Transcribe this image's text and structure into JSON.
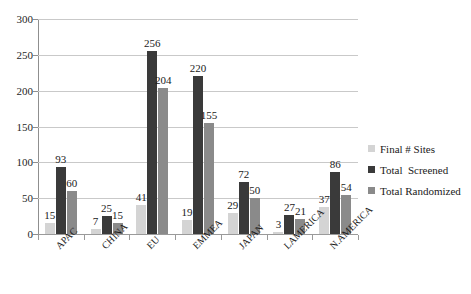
{
  "chart_data": {
    "type": "bar",
    "title": "",
    "subtitle": "",
    "xlabel": "",
    "ylabel": "",
    "ylim": [
      0,
      300
    ],
    "ytick_step": 50,
    "yticks": [
      "0",
      "50",
      "100",
      "150",
      "200",
      "250",
      "300"
    ],
    "grid": true,
    "legend_position": "right",
    "categories": [
      "APAC",
      "CHINA",
      "EU",
      "EMMEA",
      "JAPAN",
      "LAMERICA",
      "N.AMERICA"
    ],
    "series": [
      {
        "name": "Final # Sites",
        "color": "#d4d4d4",
        "values": [
          15,
          7,
          41,
          19,
          29,
          3,
          37
        ],
        "labels": [
          "15",
          "7",
          "41",
          "19",
          "29",
          "3",
          "37"
        ]
      },
      {
        "name": "Total  Screened",
        "color": "#3a3a3a",
        "values": [
          93,
          25,
          256,
          220,
          72,
          27,
          86
        ],
        "labels": [
          "93",
          "25",
          "256",
          "220",
          "72",
          "27",
          "86"
        ]
      },
      {
        "name": "Total Randomized",
        "color": "#8a8a8a",
        "values": [
          60,
          15,
          204,
          155,
          50,
          21,
          54
        ],
        "labels": [
          "60",
          "15",
          "204",
          "155",
          "50",
          "21",
          "54"
        ]
      }
    ]
  },
  "legend": {
    "items": [
      {
        "label": "Final # Sites",
        "marker": "square-swatch-light"
      },
      {
        "label": "Total  Screened",
        "marker": "square-swatch-dark"
      },
      {
        "label": "Total Randomized",
        "marker": "square-swatch-medium"
      }
    ]
  },
  "axes": {
    "y": {
      "min": 0,
      "max": 300,
      "step": 50
    },
    "x": {
      "categories": [
        "APAC",
        "CHINA",
        "EU",
        "EMMEA",
        "JAPAN",
        "LAMERICA",
        "N.AMERICA"
      ]
    }
  }
}
